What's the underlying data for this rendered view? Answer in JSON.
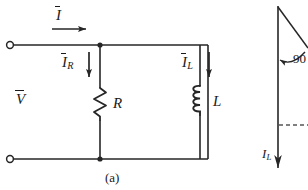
{
  "figure": {
    "caption_a": "(a)",
    "circuit": {
      "title_symbols": {
        "source_voltage": "V",
        "total_current": "I",
        "resistor_current": "I",
        "resistor_current_sub": "R",
        "inductor_current": "I",
        "inductor_current_sub": "L",
        "resistor_label": "R",
        "inductor_label": "L"
      }
    },
    "phasor": {
      "angle_label": "90",
      "current_label": "I",
      "current_label_sub": "L"
    }
  },
  "style": {
    "line_color": "#262626",
    "background": "#ffffff",
    "text_color": "#1a1a1a"
  }
}
